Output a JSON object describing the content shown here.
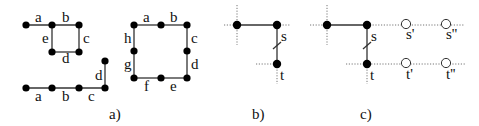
{
  "figure": {
    "panels": [
      {
        "id": "a",
        "caption": "a)"
      },
      {
        "id": "b",
        "caption": "b)"
      },
      {
        "id": "c",
        "caption": "c)"
      }
    ],
    "panel_a": {
      "square_graph": {
        "edge_labels": [
          "a",
          "b",
          "c",
          "d",
          "e"
        ]
      },
      "path_graph": {
        "edge_labels": [
          "a",
          "b",
          "c",
          "d"
        ]
      },
      "ring_graph": {
        "edge_labels": [
          "a",
          "b",
          "c",
          "d",
          "e",
          "f",
          "g",
          "h"
        ]
      }
    },
    "panel_b": {
      "node_labels": {
        "s": "s",
        "t": "t"
      }
    },
    "panel_c": {
      "node_labels": {
        "s": "s",
        "t": "t",
        "s1": "s'",
        "s2": "s''",
        "t1": "t'",
        "t2": "t''"
      }
    },
    "colors": {
      "edge": "#333333",
      "node": "#000000",
      "dotted": "#777777"
    }
  }
}
